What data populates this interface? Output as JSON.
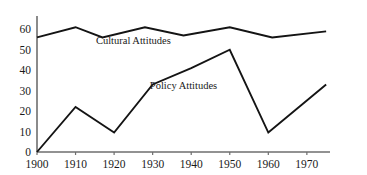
{
  "chart_data": {
    "type": "line",
    "title": "",
    "xlabel": "",
    "ylabel": "",
    "x": [
      1900,
      1910,
      1920,
      1930,
      1940,
      1950,
      1960,
      1970,
      1975
    ],
    "xlim": [
      1900,
      1976
    ],
    "ylim": [
      0,
      66
    ],
    "grid": false,
    "legend_position": "inline-labels",
    "xticks": [
      "1900",
      "1910",
      "1920",
      "1930",
      "1940",
      "1950",
      "1960",
      "1970"
    ],
    "xtick_values": [
      1900,
      1910,
      1920,
      1930,
      1940,
      1950,
      1960,
      1970
    ],
    "yticks": [
      "0",
      "10",
      "20",
      "30",
      "40",
      "50",
      "60"
    ],
    "ytick_values": [
      0,
      10,
      20,
      30,
      40,
      50,
      60
    ],
    "series": [
      {
        "name": "Cultural Attitudes",
        "label": "Cultural Attitudes",
        "color": "#141414",
        "x": [
          1900,
          1910,
          1917,
          1928,
          1938,
          1950,
          1961,
          1975
        ],
        "values": [
          56,
          61,
          56,
          61,
          57,
          61,
          56,
          59
        ]
      },
      {
        "name": "Policy Attitudes",
        "label": "Policy Attitudes",
        "color": "#141414",
        "x": [
          1900,
          1910,
          1920,
          1930,
          1940,
          1950,
          1960,
          1975
        ],
        "values": [
          0,
          22,
          9.5,
          33,
          41,
          50,
          9.5,
          33
        ]
      }
    ],
    "annotations": [
      {
        "text": "Cultural Attitudes",
        "x": 1925,
        "y": 53
      },
      {
        "text": "Policy Attitudes",
        "x": 1938,
        "y": 31
      }
    ]
  },
  "geometry": {
    "plot_left": 37,
    "plot_right": 330,
    "plot_bottom": 152,
    "plot_top": 17,
    "axis_color": "#6e6e6e",
    "line_color": "#141414",
    "background": "#ffffff"
  }
}
